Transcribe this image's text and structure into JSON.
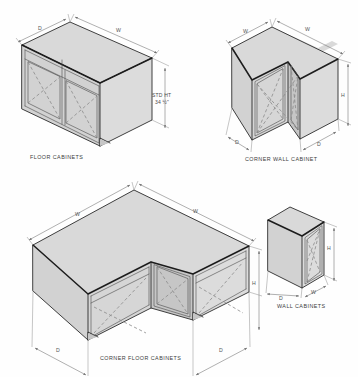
{
  "sheet": {
    "title": "Cabinet Dimension Reference Drawing",
    "background_color": "#fefefe",
    "line_color": "#2b2b2b",
    "fill_color": "#d9d9d9",
    "hidden_line_color": "#8a8a8a",
    "dimension_color": "#6e6e6e"
  },
  "figures": {
    "floor_cabinet": {
      "caption": "FLOOR CABINETS",
      "dims": {
        "depth": "D",
        "width": "W",
        "height_label_line1": "STD HT",
        "height_label_line2": "34 ½\""
      }
    },
    "corner_wall_cabinet": {
      "caption": "CORNER WALL CABINET",
      "dims": {
        "width_left": "W",
        "width_right": "W",
        "depth_left": "D",
        "depth_right": "D",
        "height": "H"
      }
    },
    "corner_floor_cabinet": {
      "caption": "CORNER FLOOR CABINETS",
      "dims": {
        "width_left": "W",
        "width_right": "W",
        "depth_left": "D",
        "depth_right": "D",
        "height": "H"
      }
    },
    "wall_cabinet": {
      "caption": "WALL CABINETS",
      "dims": {
        "depth": "D",
        "width": "W",
        "height": "H"
      }
    }
  }
}
